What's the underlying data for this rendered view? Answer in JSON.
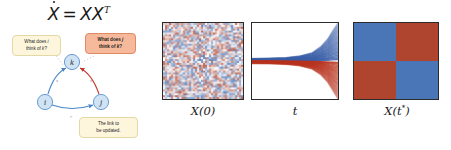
{
  "equation": {
    "lhs": "X",
    "equals": "=",
    "rhs": "XX",
    "exponent": "T",
    "full": "Ẋ = XXᵀ"
  },
  "graph": {
    "nodes": [
      {
        "id": "k",
        "label": "k",
        "x": 72,
        "y": 36,
        "fill": "#cfe3f5",
        "stroke": "#4a86c8"
      },
      {
        "id": "i",
        "label": "i",
        "x": 45,
        "y": 76,
        "fill": "#cfe3f5",
        "stroke": "#4a86c8"
      },
      {
        "id": "j",
        "label": "j",
        "x": 101,
        "y": 76,
        "fill": "#cfe3f5",
        "stroke": "#4a86c8"
      }
    ],
    "edges": [
      {
        "from": "i",
        "to": "k",
        "color": "#4a86c8",
        "label": "x"
      },
      {
        "from": "j",
        "to": "k",
        "color": "#c0392b",
        "label": "x"
      },
      {
        "from": "i",
        "to": "j",
        "color": "#4a86c8",
        "label": "r"
      }
    ],
    "callouts": [
      {
        "id": "callout-i",
        "text": "What does i think of k?",
        "line1": "What does ",
        "emph1": "i",
        "line2": "think of ",
        "emph2": "k",
        "tail": "?",
        "bg": "#fdf6dd"
      },
      {
        "id": "callout-j",
        "text": "What does j think of k?",
        "line1": "What does ",
        "emph1": "j",
        "line2": "think of ",
        "emph2": "k",
        "tail": "?",
        "bg": "#f6b99c"
      },
      {
        "id": "callout-link",
        "text": "The link to be updated.",
        "line1": "The link to",
        "line2": "be updated.",
        "bg": "#fdf6dd"
      }
    ]
  },
  "panels": [
    {
      "id": "initial-matrix",
      "label": "X(0)",
      "label_base": "X(0)",
      "type": "heatmap-noise",
      "description": "random unstructured matrix",
      "colors": {
        "positive": "#b0452f",
        "negative": "#4a76b8",
        "neutral": "#ffffff"
      }
    },
    {
      "id": "trajectories",
      "label": "t",
      "label_base": "t",
      "type": "line",
      "description": "entry trajectories diverging over time",
      "colors": {
        "positive": "#3a5fa8",
        "negative": "#b8341f"
      }
    },
    {
      "id": "final-matrix",
      "label": "X(t*)",
      "label_base": "X(t",
      "label_sup": "*",
      "label_tail": ")",
      "type": "heatmap-block",
      "description": "2x2 block structured matrix",
      "cells": [
        "#4a76b8",
        "#b0452f",
        "#b0452f",
        "#4a76b8"
      ]
    }
  ],
  "chart_data": [
    {
      "type": "heatmap",
      "title": "X(0)",
      "description": "Random initial adjacency matrix with uniformly distributed positive and negative entries; no block structure visible.",
      "rows": 40,
      "cols": 40,
      "colormap": [
        "#4a76b8",
        "#ffffff",
        "#b0452f"
      ],
      "vmin": -1,
      "vmax": 1,
      "grid": false,
      "xlabel": "",
      "ylabel": ""
    },
    {
      "type": "line",
      "title": "t",
      "description": "Trajectories of matrix entries over time: a tight bundle near t=0 that bifurcates into an upper positive (blue) branch and a lower negative (red) branch.",
      "xlabel": "t",
      "ylabel": "",
      "xlim": [
        0,
        1
      ],
      "ylim": [
        -1,
        1
      ],
      "grid": false,
      "legend": "none",
      "series": [
        {
          "name": "positive entries",
          "color": "#3a5fa8",
          "x": [
            0.0,
            0.2,
            0.4,
            0.55,
            0.7,
            0.8,
            0.88,
            0.94,
            1.0
          ],
          "values": [
            0.06,
            0.07,
            0.09,
            0.13,
            0.22,
            0.38,
            0.58,
            0.8,
            1.0
          ]
        },
        {
          "name": "negative entries",
          "color": "#b8341f",
          "x": [
            0.0,
            0.2,
            0.4,
            0.55,
            0.7,
            0.8,
            0.88,
            0.94,
            1.0
          ],
          "values": [
            -0.05,
            -0.06,
            -0.08,
            -0.12,
            -0.21,
            -0.36,
            -0.56,
            -0.78,
            -1.0
          ]
        }
      ]
    },
    {
      "type": "heatmap",
      "title": "X(t*)",
      "description": "Converged matrix showing a 2x2 block checkerboard: positive blocks on the anti-diagonal, negative blocks on the diagonal.",
      "rows": 2,
      "cols": 2,
      "values": [
        [
          -1,
          1
        ],
        [
          1,
          -1
        ]
      ],
      "colormap": [
        "#4a76b8",
        "#ffffff",
        "#b0452f"
      ],
      "vmin": -1,
      "vmax": 1,
      "grid": false,
      "xlabel": "",
      "ylabel": ""
    }
  ]
}
